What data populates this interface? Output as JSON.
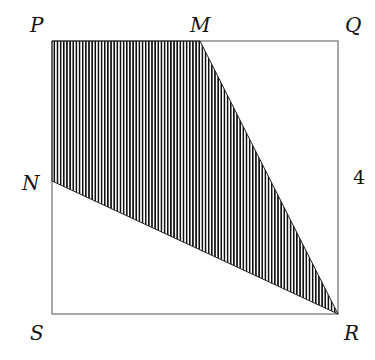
{
  "figure": {
    "type": "geometry",
    "shape": "square",
    "vertices": {
      "P": {
        "label": "P",
        "x": 52,
        "y": 41
      },
      "Q": {
        "label": "Q",
        "x": 338,
        "y": 41
      },
      "R": {
        "label": "R",
        "x": 338,
        "y": 314
      },
      "S": {
        "label": "S",
        "x": 52,
        "y": 314
      },
      "M": {
        "label": "M",
        "x": 200,
        "y": 41
      },
      "N": {
        "label": "N",
        "x": 52,
        "y": 181
      }
    },
    "side_label": "4",
    "shaded_region": [
      "P",
      "M",
      "R",
      "N"
    ],
    "shading": "vertical-stripes",
    "colors": {
      "line": "#7a7a7a",
      "stripe": "#111111",
      "background": "#ffffff"
    }
  }
}
